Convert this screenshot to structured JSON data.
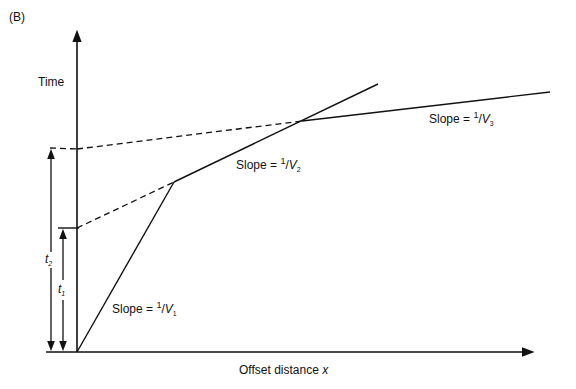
{
  "panel_label": "(B)",
  "y_axis_label": "Time",
  "x_axis_label": "Offset distance",
  "x_axis_var": "x",
  "intercepts": {
    "t1": {
      "symbol": "t",
      "sub": "1"
    },
    "t2": {
      "symbol": "t",
      "sub": "2"
    }
  },
  "slopes": [
    {
      "prefix": "Slope = ",
      "num": "1",
      "den": "V",
      "sub": "1"
    },
    {
      "prefix": "Slope = ",
      "num": "1",
      "den": "V",
      "sub": "2"
    },
    {
      "prefix": "Slope = ",
      "num": "1",
      "den": "V",
      "sub": "3"
    }
  ],
  "colors": {
    "line": "#111111",
    "background": "#ffffff"
  }
}
